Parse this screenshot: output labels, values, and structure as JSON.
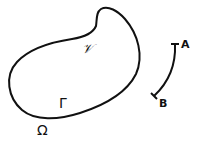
{
  "diagram": {
    "region": {
      "interior_label": "𝒱",
      "boundary_label": "Γ",
      "exterior_label": "Ω"
    },
    "arc": {
      "start_label": "A",
      "end_label": "B"
    },
    "colors": {
      "stroke": "#111111",
      "background": "#ffffff"
    }
  }
}
